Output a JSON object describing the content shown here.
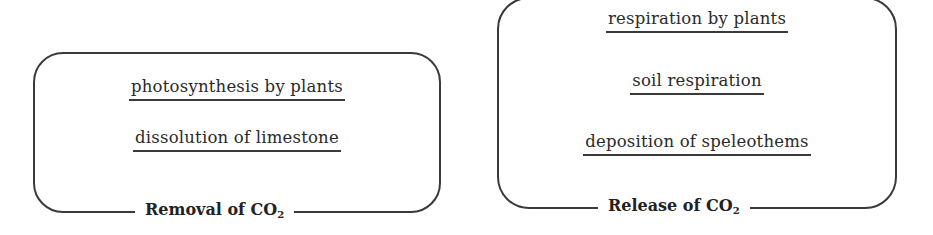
{
  "removal": {
    "title": "Removal of CO",
    "subscript": "2",
    "items": [
      "photosynthesis by plants",
      "dissolution of limestone"
    ]
  },
  "release": {
    "title": "Release of CO",
    "subscript": "2",
    "items": [
      "respiration by plants",
      "soil respiration",
      "deposition of speleothems"
    ]
  }
}
